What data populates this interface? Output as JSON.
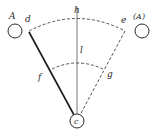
{
  "diagram": {
    "type": "pendulum-swing-geometry",
    "colors": {
      "line": "#2a2a2a",
      "background": "#ffffff"
    },
    "labels": {
      "left_circle": "A",
      "right_circle": "(A)",
      "left_arc_end": "d",
      "right_arc_end": "e",
      "vertical": "h",
      "solid_arm": "f",
      "dashed_arm": "g",
      "inner_arc": "l",
      "pivot": "c"
    }
  }
}
